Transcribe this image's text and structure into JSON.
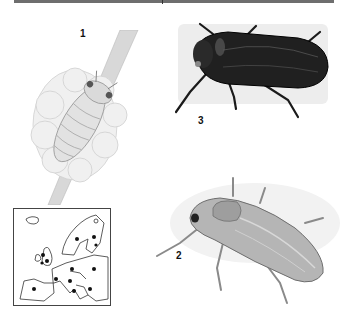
{
  "plate": {
    "figures": [
      {
        "id": "1",
        "label": "1",
        "subject": "nymph in froth on plant stem",
        "tone": "pale grey"
      },
      {
        "id": "2",
        "label": "2",
        "subject": "adult leafhopper, pale green-grey",
        "tone": "mid grey"
      },
      {
        "id": "3",
        "label": "3",
        "subject": "adult leafhopper, dark",
        "tone": "black"
      }
    ],
    "map": {
      "subject": "distribution map of Europe",
      "marker": "filled-dot",
      "dot_count": 13
    }
  }
}
